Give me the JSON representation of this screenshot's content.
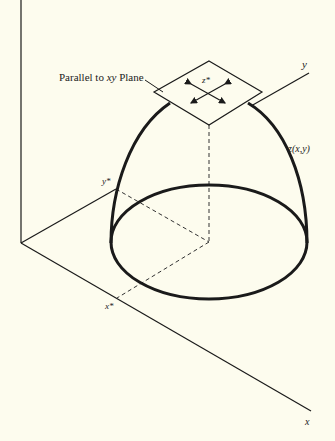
{
  "diagram": {
    "background": "#fdfcee",
    "stroke_color": "#1a1a1a",
    "labels": {
      "plane_label": "Parallel to xy Plane",
      "plane_label_prefix": "Parallel to ",
      "plane_label_xy": "xy",
      "plane_label_suffix": " Plane",
      "z_star": "z*",
      "y_axis": "y",
      "x_axis": "x",
      "y_star": "y*",
      "x_star": "x*",
      "surface": "z(x,y)"
    },
    "elements": {
      "axes": [
        "z-axis (vertical)",
        "y-axis",
        "x-axis"
      ],
      "surface": "dome z(x,y) over elliptical base",
      "tangent_plane": "diamond parallel to xy plane at peak z*",
      "projections": "dashed lines from (x*,y*) to peak"
    }
  }
}
